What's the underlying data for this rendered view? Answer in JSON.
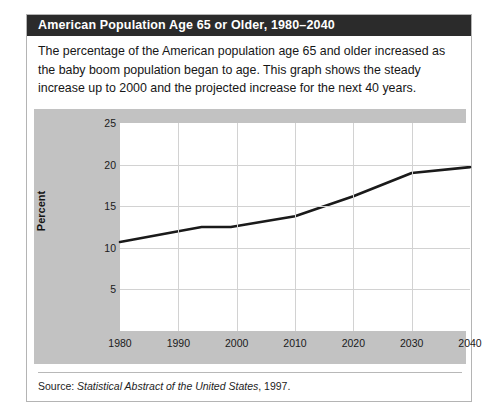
{
  "figure": {
    "title": "American Population Age 65 or Older, 1980–2040",
    "description": "The percentage of the American population age 65 and older increased as the baby boom population began to age. This graph shows the steady increase up to 2000 and the projected increase for the next 40 years.",
    "source_prefix": "Source: ",
    "source_title": "Statistical Abstract of the United States",
    "source_suffix": ", 1997.",
    "colors": {
      "title_bar": "#2b2b2b",
      "title_text": "#ffffff",
      "panel_background": "#c2c2c2",
      "plot_background": "#ffffff",
      "gridline": "#d2d2d2",
      "series_line": "#1a1a1a",
      "card_border": "#b4b4b4"
    }
  },
  "chart_data": {
    "type": "line",
    "title": "American Population Age 65 or Older, 1980–2040",
    "xlabel": "",
    "ylabel": "Percent",
    "xlim": [
      1980,
      2040
    ],
    "ylim": [
      0,
      25
    ],
    "xticks": [
      1980,
      1990,
      2000,
      2010,
      2020,
      2030,
      2040
    ],
    "yticks": [
      5,
      10,
      15,
      20,
      25
    ],
    "xtick_labels": [
      "1980",
      "1990",
      "2000",
      "2010",
      "2020",
      "2030",
      "2040"
    ],
    "ytick_labels": [
      "5",
      "10",
      "15",
      "20",
      "25"
    ],
    "grid": true,
    "legend": false,
    "series": [
      {
        "name": "Percent of population age 65 or older",
        "x": [
          1980,
          1990,
          1994,
          1999,
          2010,
          2020,
          2030,
          2040
        ],
        "values": [
          10.7,
          12.0,
          12.5,
          12.5,
          13.8,
          16.2,
          19.0,
          19.7
        ]
      }
    ]
  }
}
